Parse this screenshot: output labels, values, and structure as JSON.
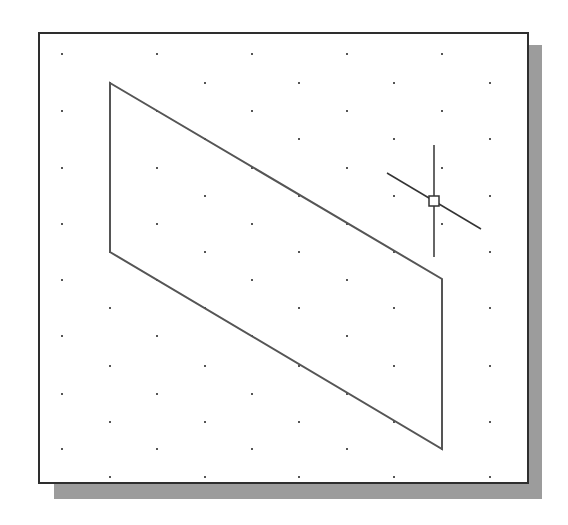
{
  "viewport": {
    "background": "#ffffff",
    "border_color": "#2e2e2e",
    "shadow_color": "#9c9c9c"
  },
  "grid": {
    "style": "isometric-dots",
    "dot_color": "#555555",
    "rows_a_y": [
      54,
      111,
      168,
      224,
      280,
      336,
      394,
      449
    ],
    "rows_a_x": [
      62,
      157,
      252,
      347,
      442
    ],
    "rows_b_y": [
      83,
      139,
      196,
      252,
      308,
      366,
      422,
      477
    ],
    "rows_b_x": [
      110,
      205,
      299,
      394,
      490
    ]
  },
  "shape": {
    "type": "parallelogram",
    "stroke": "#555555",
    "points": [
      [
        110,
        83
      ],
      [
        442,
        279
      ],
      [
        442,
        449
      ],
      [
        110,
        252
      ]
    ]
  },
  "cursor": {
    "type": "isometric-crosshair",
    "color": "#333333",
    "center": [
      434,
      201
    ],
    "vertical": [
      [
        434,
        145
      ],
      [
        434,
        257
      ]
    ],
    "diagonal": [
      [
        387,
        173
      ],
      [
        481,
        229
      ]
    ],
    "pickbox_size": 10
  }
}
